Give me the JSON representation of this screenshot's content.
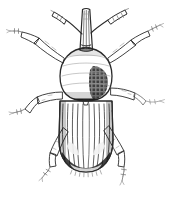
{
  "figure": {
    "kind": "scientific-line-engraving",
    "caption": "",
    "background_color": "#ffffff",
    "ink_color": "#2b2b2b",
    "mid_tone_color": "#6d6d6d",
    "faint_tone_color": "#9a9a9a",
    "pale_fill_color": "#fbfbfb",
    "dark_fill_color": "#3a3a3a",
    "canvas": {
      "width": 170,
      "height": 197
    }
  },
  "anatomy": {
    "rostrum": {
      "label": "rostrum",
      "description": "long narrow snout pointing upward",
      "top_y": 9,
      "bottom_y": 50,
      "center_x": 86,
      "width": 9
    },
    "antennae": [
      {
        "label": "left-antenna",
        "side": "left",
        "origin": [
          82,
          33
        ],
        "elbow": [
          70,
          22
        ],
        "tip": [
          54,
          11
        ],
        "club_segments": 5
      },
      {
        "label": "right-antenna",
        "side": "right",
        "origin": [
          91,
          33
        ],
        "elbow": [
          106,
          24
        ],
        "tip": [
          127,
          10
        ],
        "club_segments": 6
      }
    ],
    "pronotum": {
      "label": "pronotum",
      "description": "egg-shaped thorax densely stippled with punctures",
      "top_y": 48,
      "bottom_y": 101,
      "center_x": 86,
      "half_width": 26,
      "dark_scale_patch": {
        "x": 92,
        "y": 68,
        "width": 17,
        "height": 30
      }
    },
    "elytra": {
      "label": "elytra",
      "description": "dark wing covers with longitudinal striae and rounded apex",
      "top_y": 100,
      "apex_y": 172,
      "center_x": 86,
      "half_width": 27,
      "stria_count": 11,
      "pale_apical_patches": 2,
      "apical_fringe": true
    },
    "legs": [
      {
        "label": "front-left-leg",
        "side": "left",
        "pair": "front",
        "femur": [
          [
            62,
            56
          ],
          [
            38,
            40
          ]
        ],
        "tibia": [
          [
            38,
            40
          ],
          [
            22,
            34
          ]
        ],
        "tarsus_tip": [
          8,
          31
        ],
        "tarsus_segments": 4
      },
      {
        "label": "front-right-leg",
        "side": "right",
        "pair": "front",
        "femur": [
          [
            110,
            56
          ],
          [
            130,
            42
          ]
        ],
        "tibia": [
          [
            130,
            42
          ],
          [
            143,
            32
          ]
        ],
        "tarsus_tip": [
          155,
          24
        ],
        "tarsus_segments": 4
      },
      {
        "label": "mid-left-leg",
        "side": "left",
        "pair": "middle",
        "femur": [
          [
            62,
            97
          ],
          [
            40,
            99
          ]
        ],
        "tibia": [
          [
            40,
            99
          ],
          [
            26,
            110
          ]
        ],
        "tarsus_tip": [
          10,
          114
        ],
        "tarsus_segments": 4
      },
      {
        "label": "mid-right-leg",
        "side": "right",
        "pair": "middle",
        "femur": [
          [
            112,
            93
          ],
          [
            134,
            96
          ]
        ],
        "tibia": [
          [
            134,
            96
          ],
          [
            148,
            103
          ]
        ],
        "tarsus_tip": [
          165,
          101
        ],
        "tarsus_segments": 4
      },
      {
        "label": "hind-left-leg",
        "side": "left",
        "pair": "hind",
        "femur": [
          [
            62,
            132
          ],
          [
            48,
            152
          ]
        ],
        "tibia": [
          [
            48,
            152
          ],
          [
            50,
            166
          ]
        ],
        "tarsus_tip": [
          39,
          181
        ],
        "tarsus_segments": 4
      },
      {
        "label": "hind-right-leg",
        "side": "right",
        "pair": "hind",
        "femur": [
          [
            110,
            130
          ],
          [
            126,
            150
          ]
        ],
        "tibia": [
          [
            126,
            150
          ],
          [
            124,
            166
          ]
        ],
        "tarsus_tip": [
          122,
          184
        ],
        "tarsus_segments": 4
      }
    ]
  }
}
